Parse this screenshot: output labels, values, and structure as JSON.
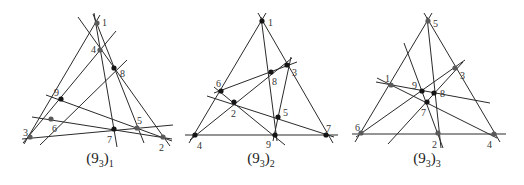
{
  "figures": [
    {
      "id": "config-1",
      "caption_main": "(9",
      "caption_sub_inner": "3",
      "caption_close": ")",
      "caption_sub_outer": "1",
      "points": [
        {
          "label": "1",
          "x": 97,
          "y": 23,
          "tone": "gray"
        },
        {
          "label": "2",
          "x": 163,
          "y": 137,
          "tone": "gray"
        },
        {
          "label": "3",
          "x": 30,
          "y": 137,
          "tone": "gray"
        },
        {
          "label": "4",
          "x": 100,
          "y": 50,
          "tone": "gray"
        },
        {
          "label": "5",
          "x": 137,
          "y": 128,
          "tone": "gray"
        },
        {
          "label": "6",
          "x": 51,
          "y": 119,
          "tone": "gray"
        },
        {
          "label": "7",
          "x": 114,
          "y": 129,
          "tone": "black"
        },
        {
          "label": "8",
          "x": 114,
          "y": 68,
          "tone": "black"
        },
        {
          "label": "9",
          "x": 61,
          "y": 99,
          "tone": "black"
        }
      ]
    },
    {
      "id": "config-2",
      "caption_main": "(9",
      "caption_sub_inner": "3",
      "caption_close": ")",
      "caption_sub_outer": "2",
      "points": [
        {
          "label": "1",
          "x": 262,
          "y": 21,
          "tone": "black"
        },
        {
          "label": "2",
          "x": 234,
          "y": 102,
          "tone": "black"
        },
        {
          "label": "3",
          "x": 287,
          "y": 65,
          "tone": "black"
        },
        {
          "label": "4",
          "x": 195,
          "y": 135,
          "tone": "black"
        },
        {
          "label": "5",
          "x": 278,
          "y": 117,
          "tone": "black"
        },
        {
          "label": "6",
          "x": 221,
          "y": 91,
          "tone": "black"
        },
        {
          "label": "7",
          "x": 326,
          "y": 135,
          "tone": "black"
        },
        {
          "label": "8",
          "x": 271,
          "y": 72,
          "tone": "black"
        },
        {
          "label": "9",
          "x": 275,
          "y": 135,
          "tone": "black"
        }
      ]
    },
    {
      "id": "config-3",
      "caption_main": "(9",
      "caption_sub_inner": "3",
      "caption_close": ")",
      "caption_sub_outer": "3",
      "points": [
        {
          "label": "1",
          "x": 391,
          "y": 85,
          "tone": "gray"
        },
        {
          "label": "2",
          "x": 438,
          "y": 133,
          "tone": "gray"
        },
        {
          "label": "3",
          "x": 455,
          "y": 68,
          "tone": "gray"
        },
        {
          "label": "4",
          "x": 494,
          "y": 134,
          "tone": "gray"
        },
        {
          "label": "5",
          "x": 428,
          "y": 21,
          "tone": "gray"
        },
        {
          "label": "6",
          "x": 361,
          "y": 133,
          "tone": "gray"
        },
        {
          "label": "7",
          "x": 427,
          "y": 102,
          "tone": "black"
        },
        {
          "label": "8",
          "x": 434,
          "y": 93,
          "tone": "black"
        },
        {
          "label": "9",
          "x": 422,
          "y": 91,
          "tone": "black"
        }
      ]
    }
  ]
}
